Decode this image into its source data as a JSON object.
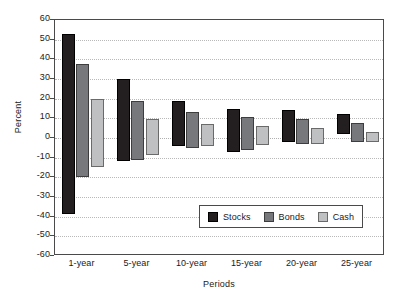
{
  "chart_data": {
    "type": "bar",
    "title": "",
    "subtitle": "",
    "xlabel": "Periods",
    "ylabel": "Percent",
    "categories": [
      "1-year",
      "5-year",
      "10-year",
      "15-year",
      "20-year",
      "25-year"
    ],
    "ylim": [
      -60,
      60
    ],
    "yticks": [
      60,
      50,
      40,
      30,
      20,
      10,
      0,
      -10,
      -20,
      -30,
      -40,
      -50,
      -60
    ],
    "ytick_labels": [
      "60",
      "50",
      "40",
      "30",
      "20",
      "10",
      "0",
      "-10",
      "-20",
      "-30",
      "-40",
      "-50",
      "-60"
    ],
    "grid": true,
    "grid_axis": "y",
    "legend_position": "inside-lower-center",
    "bar_style": "floating-range",
    "value_note": "Each bar spans from its minimum (low) to its maximum (high) annualized return for the holding period.",
    "series": [
      {
        "name": "Stocks",
        "color": "#231f20",
        "high": [
          53,
          30,
          19,
          15,
          14,
          12
        ],
        "low": [
          -38.5,
          -11.5,
          -4,
          -7,
          -2,
          2
        ]
      },
      {
        "name": "Bonds",
        "color": "#77787b",
        "high": [
          37.5,
          19,
          13,
          10.5,
          9.5,
          7.5
        ],
        "low": [
          -20,
          -11,
          -5,
          -6,
          -3,
          -2
        ]
      },
      {
        "name": "Cash",
        "color": "#bfc0c2",
        "high": [
          20,
          9.5,
          7,
          6,
          5,
          3
        ],
        "low": [
          -15,
          -8.5,
          -4,
          -3.5,
          -3,
          -2
        ]
      }
    ],
    "legend": [
      {
        "label": "Stocks",
        "color": "#231f20"
      },
      {
        "label": "Bonds",
        "color": "#77787b"
      },
      {
        "label": "Cash",
        "color": "#bfc0c2"
      }
    ]
  }
}
